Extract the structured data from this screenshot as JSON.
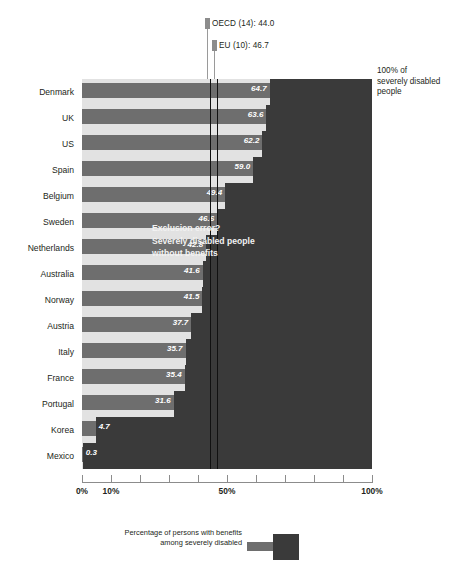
{
  "chart_data": {
    "type": "bar",
    "orientation": "horizontal",
    "title": "",
    "subtitle": "",
    "xlabel": "",
    "ylabel": "",
    "xlim": [
      0,
      100
    ],
    "grid": false,
    "categories": [
      "Denmark",
      "UK",
      "US",
      "Spain",
      "Belgium",
      "Sweden",
      "Netherlands",
      "Australia",
      "Norway",
      "Austria",
      "Italy",
      "France",
      "Portugal",
      "Korea",
      "Mexico"
    ],
    "values": [
      64.7,
      63.6,
      62.2,
      59.0,
      49.4,
      46.6,
      42.8,
      41.6,
      41.5,
      37.7,
      35.7,
      35.4,
      31.6,
      4.7,
      0.3
    ],
    "value_labels": [
      "64.7",
      "63.6",
      "62.2",
      "59.0",
      "49.4",
      "46.6",
      "42.8",
      "41.6",
      "41.5",
      "37.7",
      "35.7",
      "35.4",
      "31.6",
      "4.7",
      "0.3"
    ],
    "tick_values": [
      0,
      10,
      20,
      30,
      40,
      50,
      60,
      70,
      80,
      90,
      100
    ],
    "tick_labels": [
      "0%",
      "10%",
      "",
      "",
      "",
      "50%",
      "",
      "",
      "",
      "",
      "100%"
    ],
    "reference_lines": [
      {
        "name": "OECD (14)",
        "value": 44.0,
        "label": "OECD (14): 44.0"
      },
      {
        "name": "EU (10)",
        "value": 46.7,
        "label": "EU (10): 46.7"
      }
    ],
    "annotations": [
      {
        "name": "exclusion-error",
        "text": "Exclusion error?\nSeverely disabled people\nwithout benefits"
      },
      {
        "name": "total-population",
        "text": "100% of severely disabled people"
      }
    ],
    "legend": {
      "position": "bottom",
      "entries": [
        {
          "label": "Percentage of persons with benefits among severely disabled",
          "color": "#6e6e6e"
        }
      ]
    },
    "colors": {
      "bar": "#6e6e6e",
      "background_field": "#3a3a3a",
      "row_band": "#e2e2e2",
      "reference_line": "#111111",
      "value_text": "#ffffff"
    }
  },
  "notes": {
    "right_caption_line1": "100% of",
    "right_caption_line2": "severely disabled",
    "right_caption_line3": "people",
    "exclusion_line1": "Exclusion error?",
    "exclusion_line2": "Severely disabled people",
    "exclusion_line3": "without benefits"
  },
  "legend_text": {
    "line1": "Percentage of persons with benefits",
    "line2": "among severely disabled"
  },
  "reference": {
    "oecd_label": "OECD (14): 44.0",
    "eu_label": "EU (10): 46.7"
  }
}
